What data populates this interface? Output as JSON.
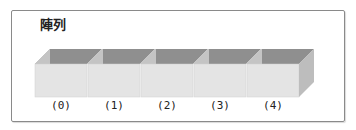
{
  "diagram": {
    "title": "陣列",
    "cells": [
      {
        "index_label": "(0)"
      },
      {
        "index_label": "(1)"
      },
      {
        "index_label": "(2)"
      },
      {
        "index_label": "(3)"
      },
      {
        "index_label": "(4)"
      }
    ],
    "colors": {
      "front_face": "#e4e4e4",
      "inner_back": "#8f8f8f",
      "side_face": "#c4c4c4",
      "frame": "#8a8a8a"
    }
  }
}
